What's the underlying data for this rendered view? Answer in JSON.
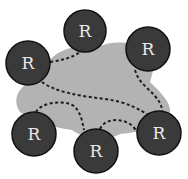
{
  "diagram": {
    "cloud_color": "#b3b3b3",
    "router_fill": "#3a3a3a",
    "router_stroke": "#111111",
    "link_color": "#1e1e1e",
    "routers": [
      {
        "id": "r1",
        "label": "R",
        "cx": 85,
        "cy": 31,
        "r": 21
      },
      {
        "id": "r2",
        "label": "R",
        "cx": 148,
        "cy": 49,
        "r": 22
      },
      {
        "id": "r3",
        "label": "R",
        "cx": 28,
        "cy": 63,
        "r": 22
      },
      {
        "id": "r4",
        "label": "R",
        "cx": 34,
        "cy": 134,
        "r": 22
      },
      {
        "id": "r5",
        "label": "R",
        "cx": 96,
        "cy": 151,
        "r": 22
      },
      {
        "id": "r6",
        "label": "R",
        "cx": 159,
        "cy": 133,
        "r": 22
      }
    ],
    "links": [
      {
        "from": "r3",
        "to": "r1",
        "style": "dashed"
      },
      {
        "from": "r2",
        "to": "r6",
        "style": "dashed"
      },
      {
        "from": "r3",
        "to": "r6",
        "style": "dashed"
      },
      {
        "from": "r4",
        "to": "r5",
        "style": "dashed"
      },
      {
        "from": "r5",
        "to": "r6",
        "style": "dashed"
      }
    ]
  }
}
